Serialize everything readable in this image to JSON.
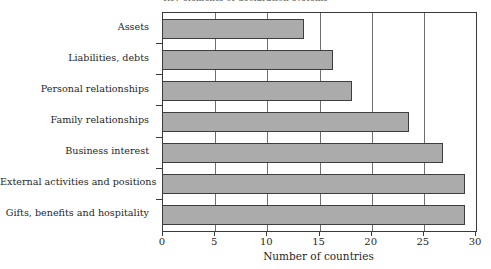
{
  "chart_data": {
    "type": "bar",
    "orientation": "horizontal",
    "title": "Key elements of declaration systems",
    "xlabel": "Number of countries",
    "ylabel": "",
    "xlim": [
      0,
      30
    ],
    "xticks": [
      0,
      5,
      10,
      15,
      20,
      25,
      30
    ],
    "grid": true,
    "legend": null,
    "categories": [
      "Assets",
      "Liabilities, debts",
      "Personal relationships",
      "Family relationships",
      "Business interest",
      "External activities and positions",
      "Gifts, benefits and hospitality"
    ],
    "values": [
      13.6,
      16.4,
      18.2,
      23.7,
      26.9,
      29.0,
      29.0
    ],
    "bar_color": "#ababab",
    "bar_edge_color": "#3d3d3d"
  },
  "axis": {
    "x_title": "Number of countries",
    "x_tick_labels": [
      "0",
      "5",
      "10",
      "15",
      "20",
      "25",
      "30"
    ]
  },
  "title": {
    "text": "Key elements of declaration systems"
  }
}
